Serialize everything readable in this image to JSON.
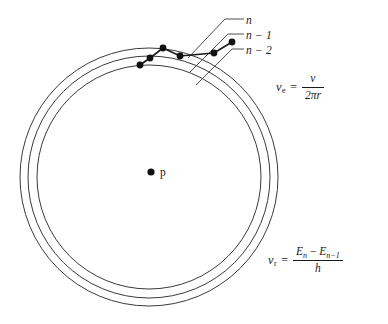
{
  "figure": {
    "type": "bohr-atom-orbital-transition-diagram",
    "background_color": "#ffffff",
    "stroke_color": "#3a3a3a",
    "ink_color": "#1a1a1a"
  },
  "orbits": {
    "center": {
      "x": 149,
      "y": 177
    },
    "labels": [
      {
        "id": "n",
        "text": "n",
        "radius": 129
      },
      {
        "id": "n-1",
        "text": "n − 1",
        "radius": 121
      },
      {
        "id": "n-2",
        "text": "n − 2",
        "radius": 112
      }
    ]
  },
  "nucleus": {
    "label": "p",
    "dot_x": 151,
    "dot_y": 172
  },
  "electron_path": {
    "description": "electron transition dots across the three orbits",
    "dots": [
      {
        "x": 232,
        "y": 42
      },
      {
        "x": 214,
        "y": 53
      },
      {
        "x": 180,
        "y": 56
      },
      {
        "x": 163,
        "y": 48
      },
      {
        "x": 150,
        "y": 58
      },
      {
        "x": 140,
        "y": 65
      }
    ]
  },
  "formulas": {
    "emission": {
      "symbol": "ν",
      "subscript": "e",
      "equals": "=",
      "numerator": "v",
      "denominator_pi": "2π",
      "denominator_r": "r"
    },
    "radiation": {
      "symbol": "ν",
      "subscript": "r",
      "equals": "=",
      "numerator_e": "E",
      "numerator_n": "n",
      "numerator_minus": "−",
      "numerator_e2": "E",
      "numerator_n2": "n−1",
      "denominator": "h"
    }
  }
}
